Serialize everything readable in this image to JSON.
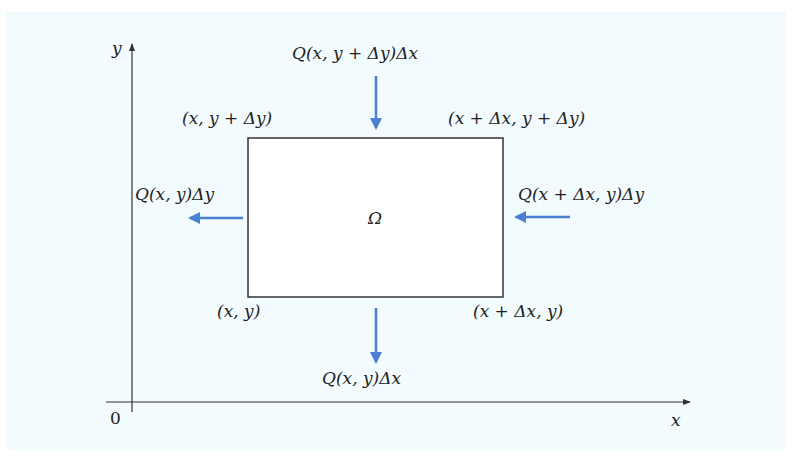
{
  "colors": {
    "background": "#f2fbfe",
    "axis": "#333333",
    "rectangle_border": "#333333",
    "rectangle_fill": "#ffffff",
    "arrow": "#4a7fd4"
  },
  "axes": {
    "x_label": "x",
    "y_label": "y",
    "origin_label": "0"
  },
  "region": {
    "label": "Ω"
  },
  "corners": {
    "top_left": "(x, y + Δy)",
    "top_right": "(x + Δx, y + Δy)",
    "bottom_left": "(x, y)",
    "bottom_right": "(x + Δx, y)"
  },
  "fluxes": {
    "top": "Q(x, y + Δy)Δx",
    "left": "Q(x, y)Δy",
    "right": "Q(x + Δx, y)Δy",
    "bottom": "Q(x, y)Δx"
  }
}
